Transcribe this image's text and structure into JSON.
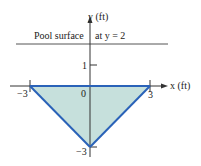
{
  "diagram": {
    "axes": {
      "x_label": "x (ft)",
      "y_label": "y (ft)",
      "x_ticks": [
        {
          "value": -3,
          "label": "−3"
        },
        {
          "value": 0,
          "label": "0"
        },
        {
          "value": 3,
          "label": "3"
        }
      ],
      "y_ticks": [
        {
          "value": 1,
          "label": "1"
        },
        {
          "value": -3,
          "label": "−3"
        }
      ]
    },
    "pool_surface": {
      "label_left": "Pool surface",
      "label_right": "at y = 2",
      "y_value": 2
    },
    "triangle": {
      "vertices": [
        [
          -3,
          0
        ],
        [
          3,
          0
        ],
        [
          0,
          -3
        ]
      ],
      "fill_color": "#c6e0dc",
      "stroke_color": "#2a62b8"
    },
    "colors": {
      "axis": "#333333",
      "surface_line": "#555555"
    }
  }
}
